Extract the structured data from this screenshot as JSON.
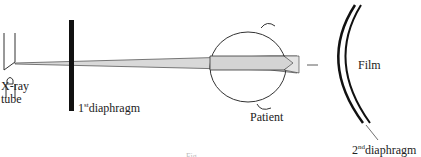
{
  "diagram": {
    "labels": {
      "xray_tube_line1": "X-ray",
      "xray_tube_line2": "tube",
      "diaphragm1_num": "1",
      "diaphragm1_sup": "st",
      "diaphragm1_text": "diaphragm",
      "patient": "Patient",
      "film": "Film",
      "diaphragm2_num": "2",
      "diaphragm2_sup": "nd",
      "diaphragm2_text": "diaphragm",
      "caption": "Fig."
    },
    "colors": {
      "line": "#222222",
      "beam": "#d8d8d8"
    }
  }
}
